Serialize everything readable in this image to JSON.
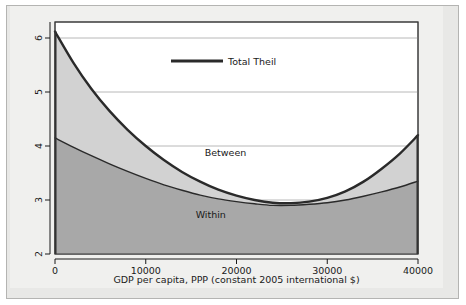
{
  "chart_data": {
    "type": "area",
    "title": "",
    "subtitle": "",
    "xlabel": "GDP per capita, PPP (constant 2005 international $)",
    "ylabel": "",
    "xlim": [
      0,
      40000
    ],
    "ylim": [
      2,
      6.3
    ],
    "grid": true,
    "grid_axis": "y",
    "legend": {
      "position": "inside-top-center",
      "entries": [
        {
          "label": "Total Theil",
          "marker": "thick-line",
          "color": "#2a2a2a"
        }
      ]
    },
    "xticks": [
      0,
      10000,
      20000,
      30000,
      40000
    ],
    "xtick_labels": [
      "0",
      "10000",
      "20000",
      "30000",
      "40000"
    ],
    "yticks": [
      2,
      3,
      4,
      5,
      6
    ],
    "ytick_labels": [
      "2",
      "3",
      "4",
      "5",
      "6"
    ],
    "annotations": [
      {
        "text": "Between",
        "x": 16500,
        "y": 3.82
      },
      {
        "text": "Within",
        "x": 15500,
        "y": 2.67
      }
    ],
    "x": [
      0,
      2000,
      4000,
      6000,
      8000,
      10000,
      12000,
      14000,
      16000,
      18000,
      20000,
      22000,
      24000,
      26000,
      28000,
      30000,
      32000,
      34000,
      36000,
      38000,
      40000
    ],
    "series": [
      {
        "name": "Total Theil",
        "color": "#2a2a2a",
        "fill": "#d2d2d2",
        "fill_label": "Between",
        "values": [
          6.12,
          5.55,
          5.06,
          4.65,
          4.3,
          4.0,
          3.74,
          3.52,
          3.34,
          3.19,
          3.08,
          3.0,
          2.95,
          2.94,
          2.97,
          3.04,
          3.16,
          3.34,
          3.58,
          3.86,
          4.2
        ]
      },
      {
        "name": "Within",
        "color": "#2a2a2a",
        "fill": "#a8a8a8",
        "fill_label": "Within",
        "values": [
          4.15,
          3.98,
          3.82,
          3.67,
          3.53,
          3.4,
          3.28,
          3.18,
          3.09,
          3.02,
          2.97,
          2.93,
          2.9,
          2.9,
          2.92,
          2.95,
          3.0,
          3.07,
          3.15,
          3.24,
          3.35
        ]
      }
    ],
    "colors": {
      "between_fill": "#d2d2d2",
      "within_fill": "#a8a8a8",
      "curve": "#2a2a2a",
      "gridline": "#b0b0b0",
      "plot_background": "#ffffff",
      "panel_background": "#e8e8e6",
      "inner_background": "#f0f0ee"
    }
  }
}
